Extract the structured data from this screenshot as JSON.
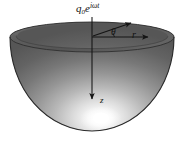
{
  "figure": {
    "name": "hemispherical-bowl-polar-coordinates",
    "background_color": "#ffffff"
  },
  "labels": {
    "source": {
      "base": "q",
      "subscript": "0",
      "exponent_base": "e",
      "exponent": "iωt",
      "full": "q₀e^{iωt}"
    },
    "radial_axis": "r",
    "angle": "θ",
    "vertical_axis": "z"
  },
  "geometry": {
    "rim_center_x": 92,
    "rim_center_y": 37,
    "rim_radius_x": 82,
    "rim_radius_y": 15,
    "bowl_bottom_y": 131,
    "origin_x": 92,
    "origin_y": 37,
    "r_arrow_end_x": 150,
    "r_arrow_end_y": 37,
    "slant_arrow_end_x": 133,
    "slant_arrow_end_y": 22,
    "z_arrow_end_y": 100,
    "highlight_x": 101,
    "highlight_y": 119
  },
  "colors": {
    "rim_top_surface": "#5f5f5f",
    "interior_dark": "#4a4a4a",
    "interior_light": "#f2f2f2",
    "outline": "#2b2b2b",
    "axis": "#1a1a1a",
    "highlight": "#ffffff",
    "label_text": "#111111"
  }
}
